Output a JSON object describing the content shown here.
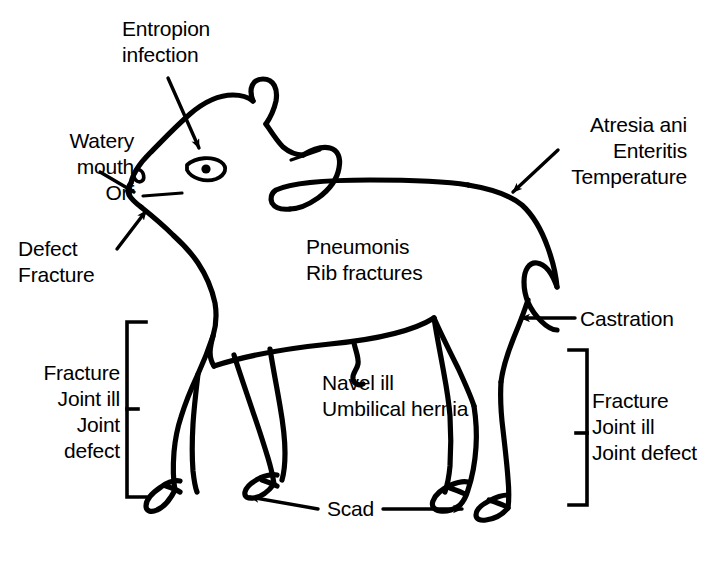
{
  "diagram": {
    "line_color": "#000000",
    "background_color": "#ffffff",
    "annotations": {
      "entropion": "Entropion\ninfection",
      "watery_mouth": "Watery\nmouth\nOrf",
      "defect_fracture": "Defect\nFracture",
      "atresia": "Atresia ani\nEnteritis\nTemperature",
      "pneumonis": "Pneumonis\nRib fractures",
      "navel": "Navel ill\nUmbilical hernia",
      "castration": "Castration",
      "bracket_left": "Fracture\nJoint ill\nJoint\ndefect",
      "bracket_right": "Fracture\nJoint ill\nJoint defect",
      "scad": "Scad"
    },
    "annotation_list": [
      {
        "id": "entropion",
        "lines": [
          "Entropion",
          "infection"
        ],
        "target": "eye",
        "marker": "arrow"
      },
      {
        "id": "watery-mouth",
        "lines": [
          "Watery",
          "mouth",
          "Orf"
        ],
        "target": "mouth",
        "marker": "arrow"
      },
      {
        "id": "defect-fracture",
        "lines": [
          "Defect",
          "Fracture"
        ],
        "target": "jaw",
        "marker": "arrow"
      },
      {
        "id": "atresia-ani",
        "lines": [
          "Atresia ani",
          "Enteritis",
          "Temperature"
        ],
        "target": "rump",
        "marker": "arrow"
      },
      {
        "id": "pneumonis",
        "lines": [
          "Pneumonis",
          "Rib fractures"
        ],
        "target": "chest",
        "marker": "none"
      },
      {
        "id": "navel-ill",
        "lines": [
          "Navel ill",
          "Umbilical hernia"
        ],
        "target": "navel",
        "marker": "none"
      },
      {
        "id": "castration",
        "lines": [
          "Castration"
        ],
        "target": "scrotum",
        "marker": "arrow"
      },
      {
        "id": "fore-legs",
        "lines": [
          "Fracture",
          "Joint ill",
          "Joint",
          "defect"
        ],
        "target": "front-legs",
        "marker": "bracket"
      },
      {
        "id": "hind-legs",
        "lines": [
          "Fracture",
          "Joint ill",
          "Joint defect"
        ],
        "target": "hind-legs",
        "marker": "bracket"
      },
      {
        "id": "scad",
        "lines": [
          "Scad"
        ],
        "target": "hooves",
        "marker": "double-arrow"
      }
    ]
  }
}
